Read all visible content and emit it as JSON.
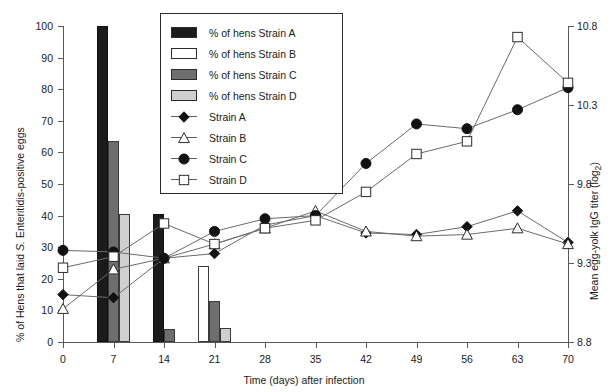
{
  "chart_data": {
    "type": "line",
    "title": "",
    "xlabel": "Time (days) after infection",
    "ylabel": "% of Hens that laid S. Enteritidis-positive eggs",
    "y2label": "Mean egg-yolk IgG titer (log2)",
    "x": [
      0,
      7,
      14,
      21,
      28,
      35,
      42,
      49,
      56,
      63,
      70
    ],
    "xticklabels": [
      "0",
      "7",
      "14",
      "21",
      "28",
      "35",
      "42",
      "49",
      "56",
      "63",
      "70"
    ],
    "ylim": [
      0,
      100
    ],
    "yticks": [
      0,
      10,
      20,
      30,
      40,
      50,
      60,
      70,
      80,
      90,
      100
    ],
    "yticklabels": [
      "0",
      "10",
      "20",
      "30",
      "40",
      "50",
      "60",
      "70",
      "80",
      "90",
      "100"
    ],
    "y2lim": [
      8.8,
      10.8
    ],
    "y2ticks": [
      8.8,
      9.3,
      9.8,
      10.3,
      10.8
    ],
    "y2ticklabels": [
      "8.8",
      "9.3",
      "9.8",
      "10.3",
      "10.8"
    ],
    "grid": false,
    "legend_position": "upper-left-inside",
    "bar_series": [
      {
        "name": "% of hens Strain A",
        "key": "A",
        "color": "#1b1b1b",
        "days": [
          7,
          14
        ],
        "values": [
          100,
          40.5
        ]
      },
      {
        "name": "% of hens Strain B",
        "key": "B",
        "color": "#ffffff",
        "days": [
          21
        ],
        "values": [
          24
        ]
      },
      {
        "name": "% of hens Strain C",
        "key": "C",
        "color": "#6e6e6e",
        "days": [
          7,
          14,
          21
        ],
        "values": [
          63.5,
          4,
          13
        ]
      },
      {
        "name": "% of hens Strain D",
        "key": "D",
        "color": "#cfcfcf",
        "days": [
          7,
          21
        ],
        "values": [
          40.5,
          4.5
        ]
      }
    ],
    "line_series": [
      {
        "name": "Strain A",
        "marker": "diamond-filled",
        "values": [
          15,
          14,
          26.5,
          28,
          37,
          40,
          34.5,
          34,
          36.5,
          41.5,
          31.5
        ]
      },
      {
        "name": "Strain B",
        "marker": "triangle-open",
        "values": [
          10.5,
          23,
          26.5,
          31,
          36,
          41.5,
          35,
          33.5,
          34,
          36,
          31
        ]
      },
      {
        "name": "Strain C",
        "marker": "circle-filled",
        "values": [
          29,
          28.5,
          26.5,
          35,
          39,
          40,
          56.5,
          69,
          67.5,
          73.5,
          80.5
        ]
      },
      {
        "name": "Strain D",
        "marker": "square-open",
        "values": [
          23.5,
          27,
          37.5,
          31,
          36,
          38.5,
          47.5,
          59.5,
          63.5,
          96.5,
          82
        ]
      }
    ]
  },
  "legend": {
    "items": [
      {
        "label": "% of hens Strain A",
        "type": "swatch",
        "fill": "#1b1b1b"
      },
      {
        "label": "% of hens Strain B",
        "type": "swatch",
        "fill": "#ffffff"
      },
      {
        "label": "% of hens Strain C",
        "type": "swatch",
        "fill": "#6e6e6e"
      },
      {
        "label": "% of hens Strain D",
        "type": "swatch",
        "fill": "#cfcfcf"
      },
      {
        "label": "Strain A",
        "type": "line",
        "marker": "diamond-filled"
      },
      {
        "label": "Strain B",
        "type": "line",
        "marker": "triangle-open"
      },
      {
        "label": "Strain C",
        "type": "line",
        "marker": "circle-filled"
      },
      {
        "label": "Strain D",
        "type": "line",
        "marker": "square-open"
      }
    ]
  }
}
